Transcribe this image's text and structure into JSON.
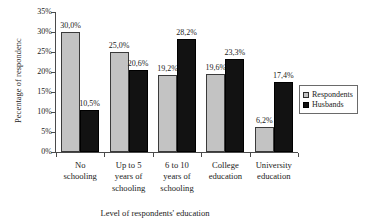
{
  "chart_data": {
    "type": "bar",
    "title": "",
    "subtitle": "",
    "xlabel": "Level of respondents' education",
    "ylabel": "Pecentage of respondenc",
    "categories": [
      "No schooling",
      "Up to 5 years of schooling",
      "6 to 10 years of schooling",
      "College education",
      "University education"
    ],
    "category_lines": [
      [
        "No",
        "schooling"
      ],
      [
        "Up to 5",
        "years of",
        "schooling"
      ],
      [
        "6 to 10",
        "years of",
        "schooling"
      ],
      [
        "College",
        "education"
      ],
      [
        "University",
        "education"
      ]
    ],
    "series": [
      {
        "name": "Respondents",
        "color": "#c3c3c3",
        "values": [
          30.0,
          25.0,
          19.2,
          19.6,
          6.2
        ],
        "labels": [
          "30,0%",
          "25,0%",
          "19,2%",
          "19,6%",
          "6,2%"
        ]
      },
      {
        "name": "Husbands",
        "color": "#121212",
        "values": [
          10.5,
          20.6,
          28.2,
          23.3,
          17.4
        ],
        "labels": [
          "10,5%",
          "20,6%",
          "28,2%",
          "23,3%",
          "17,4%"
        ]
      }
    ],
    "ylim": [
      0,
      35
    ],
    "ytick_values": [
      0,
      5,
      10,
      15,
      20,
      25,
      30,
      35
    ],
    "ytick_labels": [
      "0%",
      "5%",
      "10%",
      "15%",
      "20%",
      "25%",
      "30%",
      "35%"
    ],
    "grid": false,
    "legend_position": "right"
  },
  "legend": {
    "items": [
      {
        "label": "Respondents",
        "swatch": "respondents"
      },
      {
        "label": "Husbands",
        "swatch": "husbands"
      }
    ]
  }
}
